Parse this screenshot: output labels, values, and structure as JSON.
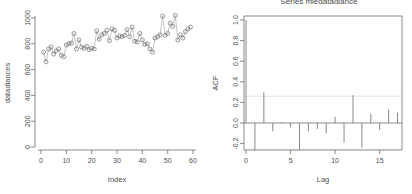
{
  "figure": {
    "panels": [
      "scatter-timeseries",
      "acf-correlogram"
    ]
  },
  "left_panel": {
    "ylabel": "datadiances",
    "xlabel": "Index",
    "ytick_labels": [
      "0",
      "200",
      "400",
      "600",
      "800",
      "1000"
    ],
    "xtick_labels": [
      "0",
      "10",
      "20",
      "30",
      "40",
      "50",
      "60"
    ]
  },
  "right_panel": {
    "title": "Series mledatadiance",
    "ylabel": "ACF",
    "xlabel": "Lag",
    "ytick_labels": [
      "-0.2",
      "0.0",
      "0.2",
      "0.4",
      "0.6",
      "0.8",
      "1.0"
    ],
    "xtick_labels": [
      "0",
      "5",
      "10",
      "15"
    ]
  },
  "chart_data": [
    {
      "type": "scatter",
      "title": "",
      "xlabel": "Index",
      "ylabel": "datadiances",
      "xlim": [
        0,
        60
      ],
      "ylim": [
        0,
        1000
      ],
      "xticks": [
        0,
        10,
        20,
        30,
        40,
        50,
        60
      ],
      "yticks": [
        0,
        200,
        400,
        600,
        800,
        1000
      ],
      "grid": false,
      "legend": "none",
      "marker": "open-circle",
      "overlay_line": true,
      "x": [
        1,
        2,
        3,
        4,
        5,
        6,
        7,
        8,
        9,
        10,
        11,
        12,
        13,
        14,
        15,
        16,
        17,
        18,
        19,
        20,
        21,
        22,
        23,
        24,
        25,
        26,
        27,
        28,
        29,
        30,
        31,
        32,
        33,
        34,
        35,
        36,
        37,
        38,
        39,
        40,
        41,
        42,
        43,
        44,
        45,
        46,
        47,
        48,
        49,
        50,
        51,
        52,
        53,
        54,
        55,
        56,
        57,
        58,
        59
      ],
      "y": [
        735,
        660,
        760,
        775,
        720,
        745,
        760,
        710,
        700,
        790,
        800,
        805,
        880,
        760,
        830,
        775,
        765,
        780,
        755,
        765,
        760,
        900,
        835,
        870,
        880,
        905,
        825,
        915,
        905,
        845,
        860,
        855,
        865,
        910,
        855,
        930,
        820,
        815,
        880,
        830,
        795,
        800,
        760,
        735,
        845,
        855,
        870,
        1015,
        865,
        880,
        960,
        935,
        1020,
        830,
        870,
        845,
        895,
        915,
        930
      ],
      "series": [
        {
          "name": "datadiances",
          "values": [
            735,
            660,
            760,
            775,
            720,
            745,
            760,
            710,
            700,
            790,
            800,
            805,
            880,
            760,
            830,
            775,
            765,
            780,
            755,
            765,
            760,
            900,
            835,
            870,
            880,
            905,
            825,
            915,
            905,
            845,
            860,
            855,
            865,
            910,
            855,
            930,
            820,
            815,
            880,
            830,
            795,
            800,
            760,
            735,
            845,
            855,
            870,
            1015,
            865,
            880,
            960,
            935,
            1020,
            830,
            870,
            845,
            895,
            915,
            930
          ]
        }
      ]
    },
    {
      "type": "bar",
      "title": "Series mledatadiance",
      "xlabel": "Lag",
      "ylabel": "ACF",
      "xlim": [
        0,
        17.5
      ],
      "ylim": [
        -0.28,
        1.05
      ],
      "xticks": [
        0,
        5,
        10,
        15
      ],
      "yticks": [
        -0.2,
        0.0,
        0.2,
        0.4,
        0.6,
        0.8,
        1.0
      ],
      "grid": false,
      "legend": "none",
      "confidence_bounds": [
        0.26,
        -0.26
      ],
      "categories": [
        0,
        1,
        2,
        3,
        4,
        5,
        6,
        7,
        8,
        9,
        10,
        11,
        12,
        13,
        14,
        15,
        16,
        17
      ],
      "values": [
        1.0,
        -0.26,
        0.3,
        -0.08,
        0.01,
        -0.04,
        -0.26,
        -0.08,
        -0.06,
        -0.1,
        0.06,
        -0.19,
        0.27,
        -0.24,
        0.09,
        -0.07,
        0.13,
        0.1
      ],
      "series": [
        {
          "name": "ACF",
          "values": [
            1.0,
            -0.26,
            0.3,
            -0.08,
            0.01,
            -0.04,
            -0.26,
            -0.08,
            -0.06,
            -0.1,
            0.06,
            -0.19,
            0.27,
            -0.24,
            0.09,
            -0.07,
            0.13,
            0.1
          ]
        }
      ]
    }
  ]
}
